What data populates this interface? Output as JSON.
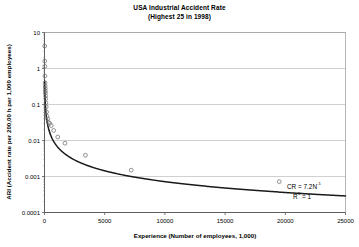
{
  "chart_data": {
    "type": "scatter",
    "title": "USA Industrial Accident Rate",
    "subtitle": "(Highest 25 in 1998)",
    "xlabel": "Experience (Number of employees, 1,000)",
    "ylabel": "ARI (Accident rate per 200,00 h per 1,000 employees)",
    "xscale": "linear",
    "yscale": "log",
    "xlim": [
      0,
      25000
    ],
    "ylim": [
      0.0001,
      10
    ],
    "xticks": [
      0,
      5000,
      10000,
      15000,
      20000,
      25000
    ],
    "xtick_labels": [
      "0",
      "5000",
      "10000",
      "15000",
      "20000",
      "25000"
    ],
    "yticks": [
      0.0001,
      0.001,
      0.01,
      0.1,
      1,
      10
    ],
    "ytick_labels": [
      "0.0001",
      "0.001",
      "0.01",
      "0.1",
      "1",
      "10"
    ],
    "grid": "horizontal",
    "legend": "none",
    "marker": "open-circle",
    "series": [
      {
        "name": "Accident rate observations",
        "points": [
          [
            18,
            4.2
          ],
          [
            22,
            1.6
          ],
          [
            30,
            1.15
          ],
          [
            38,
            0.62
          ],
          [
            45,
            0.4
          ],
          [
            55,
            0.33
          ],
          [
            62,
            0.28
          ],
          [
            70,
            0.24
          ],
          [
            78,
            0.21
          ],
          [
            88,
            0.175
          ],
          [
            100,
            0.145
          ],
          [
            118,
            0.112
          ],
          [
            140,
            0.086
          ],
          [
            170,
            0.062
          ],
          [
            210,
            0.047
          ],
          [
            260,
            0.04
          ],
          [
            330,
            0.032
          ],
          [
            430,
            0.03
          ],
          [
            560,
            0.026
          ],
          [
            760,
            0.019
          ],
          [
            1100,
            0.0125
          ],
          [
            1700,
            0.0084
          ],
          [
            3400,
            0.0039
          ],
          [
            7200,
            0.0015
          ],
          [
            19500,
            0.00072
          ]
        ]
      }
    ],
    "fit": {
      "equation_label": "CR = 7.2N",
      "equation_exponent": "-1",
      "r2_label": "R",
      "r2_exponent": "2",
      "r2_value": "= 1",
      "coefficient": 7.2,
      "exponent": -1,
      "r_squared": 1
    }
  }
}
